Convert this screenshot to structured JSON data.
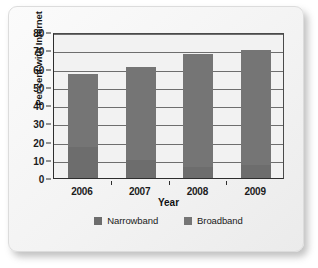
{
  "chart_data": {
    "type": "bar",
    "subtype": "stacked-bar",
    "title": "",
    "xlabel": "Year",
    "ylabel": "Per cent with Internet",
    "categories": [
      "2006",
      "2007",
      "2008",
      "2009"
    ],
    "series": [
      {
        "name": "Narrowband",
        "color": "#6d6d6d",
        "values": [
          17,
          10,
          6,
          7
        ]
      },
      {
        "name": "Broadband",
        "color": "#757575",
        "values": [
          40,
          51,
          62,
          63
        ]
      }
    ],
    "totals": [
      57,
      61,
      68,
      70
    ],
    "ylim": [
      0,
      80
    ],
    "ytick_step": 10,
    "yticks": [
      "0",
      "10",
      "20",
      "30",
      "40",
      "50",
      "60",
      "70",
      "80"
    ],
    "grid": "horizontal",
    "legend_position": "bottom",
    "legend_entries": [
      "Narrowband",
      "Broadband"
    ]
  },
  "figure": {
    "background_color": "#f2f2f2",
    "axis_color": "#2e2e2e",
    "gridline_color": "#6e6e6e"
  }
}
